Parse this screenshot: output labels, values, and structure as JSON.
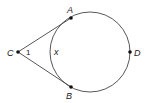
{
  "diagram": {
    "type": "geometry",
    "colors": {
      "stroke": "#444444",
      "point": "#111111",
      "text": "#222222",
      "background": "#ffffff"
    },
    "circle": {
      "cx": 90,
      "cy": 52,
      "r": 40
    },
    "points": {
      "C": {
        "label": "C",
        "x": 18,
        "y": 52
      },
      "A": {
        "label": "A",
        "x": 71,
        "y": 18
      },
      "B": {
        "label": "B",
        "x": 71,
        "y": 87
      },
      "D": {
        "label": "D",
        "x": 130,
        "y": 52
      }
    },
    "segments": [
      {
        "from": "C",
        "to": "A",
        "label": "CA"
      },
      {
        "from": "C",
        "to": "B",
        "label": "CB"
      }
    ],
    "annotations": {
      "angle_label": "1",
      "arc_label": "x"
    }
  }
}
